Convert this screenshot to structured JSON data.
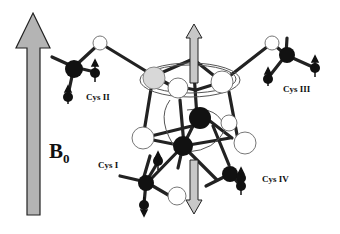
{
  "field": {
    "label": "B",
    "subscript": "0",
    "arrow_color": "#b4b4b4"
  },
  "residues": [
    {
      "label": "Cys II"
    },
    {
      "label": "Cys III"
    },
    {
      "label": "Cys I"
    },
    {
      "label": "Cys IV"
    }
  ],
  "colors": {
    "bond": "#222222",
    "atom_dark": "#111111",
    "atom_light": "#ffffff",
    "atom_gray": "#d8d8d8",
    "spin_arrow": "#c8c8c8"
  }
}
